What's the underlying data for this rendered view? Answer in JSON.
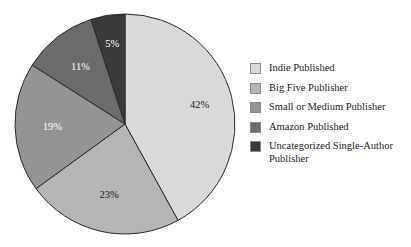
{
  "chart_data": {
    "type": "pie",
    "title": "",
    "subtitle": "",
    "xlabel": "",
    "ylabel": "",
    "grid": false,
    "legend_position": "right",
    "categories": [
      "Indie Published",
      "Big Five Publisher",
      "Small or Medium Publisher",
      "Amazon Published",
      "Uncategorized Single-Author Publisher"
    ],
    "values": [
      42,
      23,
      19,
      11,
      5
    ],
    "value_unit": "%",
    "data_labels": [
      "42%",
      "23%",
      "19%",
      "11%",
      "5%"
    ],
    "colors": [
      "#d9d9d9",
      "#b5b5b5",
      "#949494",
      "#6b6b6b",
      "#3a3a3a"
    ],
    "start_angle_deg": 0,
    "direction": "clockwise",
    "slices": [
      {
        "label": "Indie Published",
        "value": 42,
        "data_label": "42%",
        "color": "#d9d9d9",
        "label_color": "dark",
        "start_deg": 0,
        "end_deg": 151.2
      },
      {
        "label": "Big Five Publisher",
        "value": 23,
        "data_label": "23%",
        "color": "#b5b5b5",
        "label_color": "dark",
        "start_deg": 151.2,
        "end_deg": 234.0
      },
      {
        "label": "Small or Medium Publisher",
        "value": 19,
        "data_label": "19%",
        "color": "#949494",
        "label_color": "light",
        "start_deg": 234.0,
        "end_deg": 302.4
      },
      {
        "label": "Amazon Published",
        "value": 11,
        "data_label": "11%",
        "color": "#6b6b6b",
        "label_color": "light",
        "start_deg": 302.4,
        "end_deg": 342.0
      },
      {
        "label": "Uncategorized Single-Author Publisher",
        "value": 5,
        "data_label": "5%",
        "color": "#3a3a3a",
        "label_color": "light",
        "start_deg": 342.0,
        "end_deg": 360.0
      }
    ]
  },
  "legend": {
    "items": [
      {
        "label": "Indie Published",
        "color": "#d9d9d9"
      },
      {
        "label": "Big Five Publisher",
        "color": "#b5b5b5"
      },
      {
        "label": "Small or Medium Publisher",
        "color": "#949494"
      },
      {
        "label": "Amazon Published",
        "color": "#6b6b6b"
      },
      {
        "label": "Uncategorized Single-Author\nPublisher",
        "color": "#3a3a3a"
      }
    ]
  }
}
